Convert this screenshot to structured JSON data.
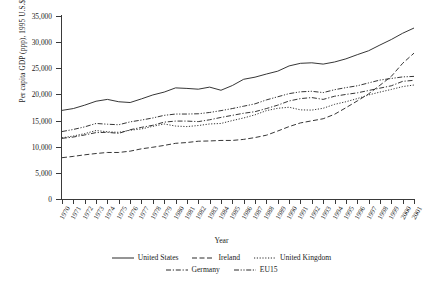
{
  "chart_data": {
    "type": "line",
    "title": "",
    "xlabel": "Year",
    "ylabel": "Per capita GDP (ppp), 1995 U.S.$",
    "ylim": [
      0,
      35000
    ],
    "yticks": [
      0,
      5000,
      10000,
      15000,
      20000,
      25000,
      30000,
      35000
    ],
    "ytick_labels": [
      "0",
      "5,000",
      "10,000",
      "15,000",
      "20,000",
      "25,000",
      "30,000",
      "35,000"
    ],
    "grid": false,
    "legend_position": "bottom",
    "x": [
      1970,
      1971,
      1972,
      1973,
      1974,
      1975,
      1976,
      1977,
      1978,
      1979,
      1980,
      1981,
      1982,
      1983,
      1984,
      1985,
      1986,
      1987,
      1988,
      1989,
      1990,
      1991,
      1992,
      1993,
      1994,
      1995,
      1996,
      1997,
      1998,
      1999,
      2000,
      2001
    ],
    "xtick_labels": [
      "1970",
      "1971",
      "1972",
      "1973",
      "1974",
      "1975",
      "1976",
      "1977",
      "1978",
      "1979",
      "1980",
      "1981",
      "1982",
      "1983",
      "1984",
      "1985",
      "1986",
      "1987",
      "1988",
      "1989",
      "1990",
      "1991",
      "1992",
      "1993",
      "1994",
      "1995",
      "1996",
      "1997",
      "1998",
      "1999",
      "2000",
      "2001"
    ],
    "series": [
      {
        "name": "United States",
        "style": "solid",
        "color": "#2b2b2b",
        "values": [
          16950,
          17300,
          17950,
          18700,
          19050,
          18600,
          18450,
          19150,
          19900,
          20450,
          21250,
          21150,
          21000,
          21400,
          20800,
          21700,
          22900,
          23300,
          23900,
          24450,
          25450,
          25950,
          26050,
          25800,
          26200,
          26800,
          27600,
          28350,
          29450,
          30500,
          31700,
          32700
        ]
      },
      {
        "name": "Ireland",
        "style": "dashed",
        "color": "#2b2b2b",
        "values": [
          7900,
          8150,
          8450,
          8700,
          8900,
          8900,
          9150,
          9600,
          9900,
          10250,
          10650,
          10800,
          11050,
          11100,
          11200,
          11200,
          11400,
          11750,
          12200,
          13000,
          13850,
          14550,
          14950,
          15350,
          16200,
          17450,
          18750,
          20100,
          21750,
          23450,
          25950,
          27900
        ]
      },
      {
        "name": "United Kingdom",
        "style": "dotted",
        "color": "#2b2b2b",
        "values": [
          11700,
          12050,
          12500,
          13100,
          12850,
          12750,
          13150,
          13400,
          13900,
          14350,
          13950,
          13850,
          14050,
          14350,
          14450,
          15000,
          15500,
          16100,
          16900,
          17350,
          17550,
          17050,
          17000,
          17350,
          18100,
          18600,
          19200,
          19900,
          20450,
          20950,
          21500,
          21800
        ]
      },
      {
        "name": "Germany",
        "style": "dashdot",
        "color": "#2b2b2b",
        "values": [
          11600,
          11850,
          12250,
          12700,
          12750,
          12550,
          13250,
          13700,
          14100,
          14700,
          14900,
          14900,
          14800,
          15150,
          15600,
          16000,
          16400,
          16700,
          17300,
          17950,
          18750,
          19200,
          19400,
          19050,
          19650,
          20000,
          20300,
          20750,
          21200,
          21650,
          22500,
          22700
        ]
      },
      {
        "name": "EU15",
        "style": "dashdotdot",
        "color": "#2b2b2b",
        "values": [
          12900,
          13300,
          13800,
          14450,
          14300,
          14200,
          14750,
          15100,
          15500,
          16000,
          16250,
          16250,
          16300,
          16550,
          16900,
          17300,
          17750,
          18200,
          18950,
          19550,
          20150,
          20500,
          20600,
          20350,
          20900,
          21300,
          21650,
          22200,
          22750,
          23050,
          23350,
          23450
        ]
      }
    ]
  },
  "legend": {
    "row1": [
      {
        "label": "United States",
        "style": "solid"
      },
      {
        "label": "Ireland",
        "style": "dashed"
      },
      {
        "label": "United Kingdom",
        "style": "dotted"
      }
    ],
    "row2": [
      {
        "label": "Germany",
        "style": "dashdot"
      },
      {
        "label": "EU15",
        "style": "dashdotdot"
      }
    ]
  }
}
